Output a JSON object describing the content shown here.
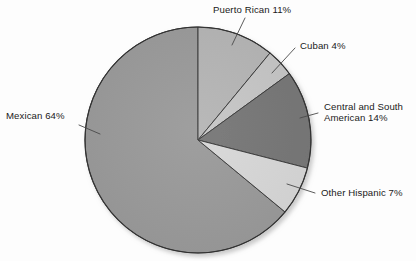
{
  "chart_data": {
    "type": "pie",
    "title": "",
    "subtitle": "",
    "xlabel": "",
    "ylabel": "",
    "legend_position": "callout-labels",
    "grid": false,
    "unit": "%",
    "start_angle_deg": 0,
    "direction": "clockwise",
    "categories": [
      "Puerto Rican",
      "Cuban",
      "Central and South American",
      "Other Hispanic",
      "Mexican"
    ],
    "values": [
      11,
      4,
      14,
      7,
      64
    ],
    "labels": [
      "Puerto Rican 11%",
      "Cuban 4%",
      "Central and South American 14%",
      "Other Hispanic 7%",
      "Mexican 64%"
    ],
    "colors": [
      "#b5b5b5",
      "#c6c6c6",
      "#767676",
      "#d8d8d8",
      "#9a9a9a"
    ],
    "slices": [
      {
        "name": "Puerto Rican",
        "value": 11,
        "color": "#b5b5b5"
      },
      {
        "name": "Cuban",
        "value": 4,
        "color": "#c6c6c6"
      },
      {
        "name": "Central and South American",
        "value": 14,
        "color": "#767676"
      },
      {
        "name": "Other Hispanic",
        "value": 7,
        "color": "#d8d8d8"
      },
      {
        "name": "Mexican",
        "value": 64,
        "color": "#9a9a9a"
      }
    ]
  },
  "callouts": {
    "puerto_rican": "Puerto Rican 11%",
    "cuban": "Cuban 4%",
    "central_south_line1": "Central and South",
    "central_south_line2": "American 14%",
    "other_hispanic": "Other Hispanic 7%",
    "mexican": "Mexican 64%"
  },
  "style": {
    "background": "#fdfdfd",
    "outline": "#333333",
    "text": "#1a1a1a",
    "leader_line": "#4a4a4a"
  }
}
